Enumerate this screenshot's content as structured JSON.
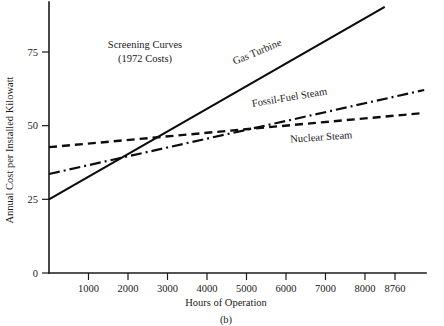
{
  "figure": {
    "caption": "(b)",
    "annotation_line1": "Screening Curves",
    "annotation_line2": "(1972 Costs)"
  },
  "chart_data": {
    "type": "line",
    "xlabel": "Hours of Operation",
    "ylabel": "Annual Cost per Installed Kilowatt",
    "xlim": [
      0,
      9600
    ],
    "ylim": [
      0,
      92
    ],
    "grid": false,
    "legend_position": "inline-labels",
    "x_ticks": [
      1000,
      2000,
      3000,
      4000,
      5000,
      6000,
      7000,
      8000,
      8760
    ],
    "x_tick_labels": [
      "1000",
      "2000",
      "3000",
      "4000",
      "5000",
      "6000",
      "7000",
      "8000",
      "8760"
    ],
    "y_ticks": [
      0,
      25,
      50,
      75
    ],
    "y_tick_labels": [
      "0",
      "25",
      "50",
      "75"
    ],
    "series": [
      {
        "name": "Gas Turbine",
        "style": "solid",
        "x": [
          0,
          8500
        ],
        "values": [
          25.0,
          90.3
        ],
        "label_x": 5300,
        "label_y": 74.0,
        "label_rotation": -22.5
      },
      {
        "name": "Fossil-Fuel Steam",
        "style": "dash-dot",
        "x": [
          0,
          9500
        ],
        "values": [
          33.6,
          62.1
        ],
        "label_x": 6100,
        "label_y": 58.5,
        "label_rotation": -9.5
      },
      {
        "name": "Nuclear Steam",
        "style": "dashed",
        "x": [
          0,
          9500
        ],
        "values": [
          42.7,
          54.3
        ],
        "label_x": 6900,
        "label_y": 45.0,
        "label_rotation": -4.0
      }
    ],
    "crossings": [
      {
        "series_a": "Gas Turbine",
        "series_b": "Fossil-Fuel Steam",
        "x": 1750,
        "y": 38.9
      },
      {
        "series_a": "Gas Turbine",
        "series_b": "Nuclear Steam",
        "x": 2650,
        "y": 45.6
      },
      {
        "series_a": "Fossil-Fuel Steam",
        "series_b": "Nuclear Steam",
        "x": 5150,
        "y": 49.5
      }
    ]
  },
  "colors": {
    "ink": "#0d0d0d",
    "axis": "#1a1a1a",
    "background": "#ffffff"
  }
}
